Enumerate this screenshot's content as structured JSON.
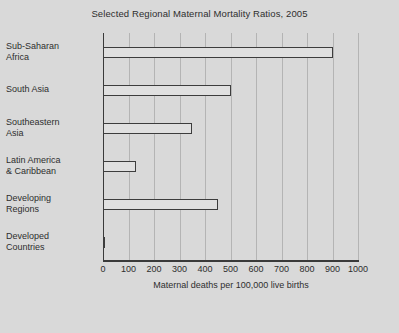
{
  "chart_data": {
    "type": "bar",
    "orientation": "horizontal",
    "title": "Selected Regional Maternal Mortality Ratios, 2005",
    "xlabel": "Maternal deaths per 100,000 live births",
    "ylabel": "",
    "xlim": [
      0,
      1000
    ],
    "xticks": [
      0,
      100,
      200,
      300,
      400,
      500,
      600,
      700,
      800,
      900,
      1000
    ],
    "xtick_labels": [
      "0",
      "100",
      "200",
      "300",
      "400",
      "500",
      "600",
      "700",
      "800",
      "900",
      "1000"
    ],
    "grid": true,
    "legend": null,
    "categories": [
      "Sub-Saharan Africa",
      "South Asia",
      "Southeastern Asia",
      "Latin America & Caribbean",
      "Developing Regions",
      "Developed Countries"
    ],
    "values": [
      900,
      500,
      350,
      130,
      450,
      9
    ],
    "bars": [
      {
        "label_line1": "Sub-Saharan",
        "label_line2": "Africa",
        "value": 900
      },
      {
        "label_line1": "South Asia",
        "label_line2": "",
        "value": 500
      },
      {
        "label_line1": "Southeastern",
        "label_line2": "Asia",
        "value": 350
      },
      {
        "label_line1": "Latin America",
        "label_line2": "& Caribbean",
        "value": 130
      },
      {
        "label_line1": "Developing",
        "label_line2": "Regions",
        "value": 450
      },
      {
        "label_line1": "Developed",
        "label_line2": "Countries",
        "value": 9
      }
    ]
  },
  "colors": {
    "background": "#d9d9d9",
    "bar_fill": "#e0e0e0",
    "bar_edge": "#3d3d3d",
    "gridline": "#b4b4b4",
    "axis": "#3a3a3a",
    "text": "#2e2e2e"
  }
}
